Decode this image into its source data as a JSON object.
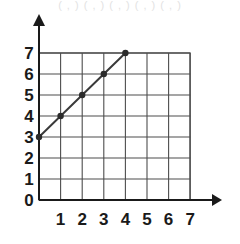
{
  "header": {
    "faint_text": "( , ) ( , ) ( , ) ( , ) ( , )"
  },
  "chart_data": {
    "type": "line",
    "title": "",
    "xlabel": "",
    "ylabel": "",
    "xlim": [
      0,
      7
    ],
    "ylim": [
      0,
      7
    ],
    "grid": true,
    "legend": null,
    "x_ticks": [
      "1",
      "2",
      "3",
      "4",
      "5",
      "6",
      "7"
    ],
    "x_tick_values": [
      1,
      2,
      3,
      4,
      5,
      6,
      7
    ],
    "y_ticks": [
      "0",
      "1",
      "2",
      "3",
      "4",
      "5",
      "6",
      "7"
    ],
    "y_tick_values": [
      0,
      1,
      2,
      3,
      4,
      5,
      6,
      7
    ],
    "x": [
      0,
      1,
      2,
      3,
      4
    ],
    "values": [
      3,
      4,
      5,
      6,
      7
    ],
    "points": [
      {
        "x": 0,
        "y": 3
      },
      {
        "x": 1,
        "y": 4
      },
      {
        "x": 2,
        "y": 5
      },
      {
        "x": 3,
        "y": 6
      },
      {
        "x": 4,
        "y": 7
      }
    ],
    "line_color": "#3a3a3a",
    "point_color": "#2b2b2b",
    "grid_color": "#4d4d4d",
    "axis_color": "#1a1a1a",
    "background_color": "#ffffff"
  }
}
